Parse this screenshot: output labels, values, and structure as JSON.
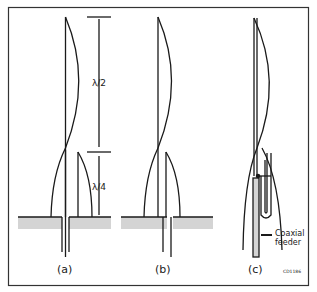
{
  "figure": {
    "id_code": "CD1186",
    "panels": [
      {
        "label": "(a)"
      },
      {
        "label": "(b)"
      },
      {
        "label": "(c)"
      }
    ],
    "dimensions": {
      "half_wave": "λ/2",
      "quarter_wave": "λ/4"
    },
    "annotations": {
      "coax_line1": "Coaxial",
      "coax_line2": "feeder"
    },
    "colors": {
      "line": "#1a1a1a",
      "ground": "#d4d4d4",
      "frame": "#333333"
    }
  }
}
